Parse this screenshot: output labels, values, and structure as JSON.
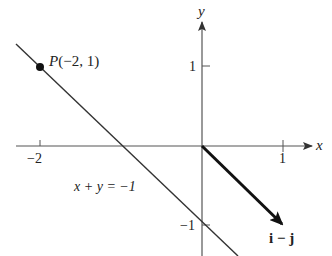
{
  "figure": {
    "axes": {
      "x_label": "x",
      "y_label": "y",
      "x_ticks": [
        {
          "value": -2,
          "label": "−2"
        },
        {
          "value": 1,
          "label": "1"
        }
      ],
      "y_ticks": [
        {
          "value": 1,
          "label": "1"
        },
        {
          "value": -1,
          "label": "−1"
        }
      ]
    },
    "point": {
      "label": "P(−2, 1)",
      "x": -2,
      "y": 1
    },
    "line": {
      "equation": "x + y = −1"
    },
    "vector": {
      "label": "i − j",
      "from": [
        0,
        0
      ],
      "to": [
        1,
        -1
      ]
    },
    "colors": {
      "axis": "#555555",
      "line": "#333333",
      "vector": "#111111",
      "point": "#111111"
    }
  }
}
